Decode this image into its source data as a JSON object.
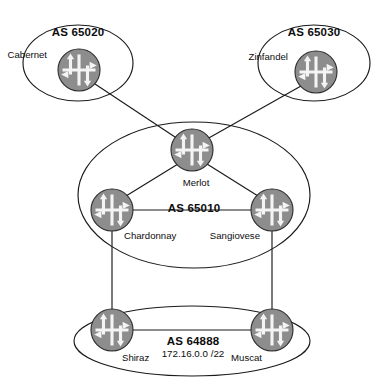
{
  "diagram": {
    "canvas": {
      "width": 386,
      "height": 392,
      "background": "#ffffff"
    },
    "colors": {
      "line": "#1a1a1a",
      "router_fill": "#8d8d8d",
      "router_shade": "#747474",
      "router_glyph": "#f4f4f4",
      "text": "#0d0d0d"
    }
  },
  "autonomous_systems": [
    {
      "id": "as65020",
      "label": "AS 65020",
      "label_x": 78,
      "label_y": 36,
      "ellipse": {
        "cx": 78,
        "cy": 63,
        "rx": 55,
        "ry": 38
      }
    },
    {
      "id": "as65030",
      "label": "AS 65030",
      "label_x": 314,
      "label_y": 36,
      "ellipse": {
        "cx": 314,
        "cy": 63,
        "rx": 56,
        "ry": 38
      }
    },
    {
      "id": "as65010",
      "label": "AS 65010",
      "label_x": 194,
      "label_y": 212,
      "ellipse": {
        "cx": 194,
        "cy": 195,
        "rx": 116,
        "ry": 73
      }
    },
    {
      "id": "as64888",
      "label": "AS 64888",
      "sublabel": "172.16.0.0 /22",
      "label_x": 193,
      "label_y": 345,
      "sublabel_x": 193,
      "sublabel_y": 357,
      "ellipse": {
        "cx": 192,
        "cy": 341,
        "rx": 118,
        "ry": 35
      }
    }
  ],
  "routers": [
    {
      "id": "cabernet",
      "label": "Cabernet",
      "cx": 79,
      "cy": 70,
      "r": 21,
      "label_x": 47,
      "label_y": 58,
      "anchor": "end"
    },
    {
      "id": "zinfandel",
      "label": "Zinfandel",
      "cx": 316,
      "cy": 72,
      "r": 21,
      "label_x": 288,
      "label_y": 60,
      "anchor": "end"
    },
    {
      "id": "merlot",
      "label": "Merlot",
      "cx": 192,
      "cy": 150,
      "r": 21,
      "label_x": 196,
      "label_y": 186,
      "anchor": "middle"
    },
    {
      "id": "chardonnay",
      "label": "Chardonnay",
      "cx": 112,
      "cy": 210,
      "r": 21,
      "label_x": 124,
      "label_y": 239,
      "anchor": "start"
    },
    {
      "id": "sangiovese",
      "label": "Sangiovese",
      "cx": 272,
      "cy": 210,
      "r": 21,
      "label_x": 260,
      "label_y": 239,
      "anchor": "end"
    },
    {
      "id": "shiraz",
      "label": "Shiraz",
      "cx": 112,
      "cy": 330,
      "r": 21,
      "label_x": 122,
      "label_y": 361,
      "anchor": "start"
    },
    {
      "id": "muscat",
      "label": "Muscat",
      "cx": 272,
      "cy": 330,
      "r": 21,
      "label_x": 262,
      "label_y": 361,
      "anchor": "end"
    }
  ],
  "links": [
    {
      "id": "cabernet-merlot",
      "from": "cabernet",
      "to": "merlot",
      "x1": 95,
      "y1": 84,
      "x2": 178,
      "y2": 139
    },
    {
      "id": "zinfandel-merlot",
      "from": "zinfandel",
      "to": "merlot",
      "x1": 301,
      "y1": 86,
      "x2": 207,
      "y2": 139
    },
    {
      "id": "merlot-chardonnay",
      "from": "merlot",
      "to": "chardonnay",
      "x1": 178,
      "y1": 164,
      "x2": 126,
      "y2": 196
    },
    {
      "id": "merlot-sangiovese",
      "from": "merlot",
      "to": "sangiovese",
      "x1": 207,
      "y1": 164,
      "x2": 258,
      "y2": 196
    },
    {
      "id": "chardonnay-sangiovese",
      "from": "chardonnay",
      "to": "sangiovese",
      "x1": 133,
      "y1": 210,
      "x2": 251,
      "y2": 210
    },
    {
      "id": "chardonnay-shiraz",
      "from": "chardonnay",
      "to": "shiraz",
      "x1": 112,
      "y1": 231,
      "x2": 112,
      "y2": 309
    },
    {
      "id": "sangiovese-muscat",
      "from": "sangiovese",
      "to": "muscat",
      "x1": 272,
      "y1": 231,
      "x2": 272,
      "y2": 309
    },
    {
      "id": "shiraz-muscat",
      "from": "shiraz",
      "to": "muscat",
      "x1": 133,
      "y1": 330,
      "x2": 251,
      "y2": 330
    }
  ],
  "icons": {
    "router": "router-icon"
  }
}
